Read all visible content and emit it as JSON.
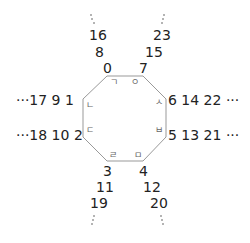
{
  "diagram": {
    "type": "octagon-cycle",
    "vertices": [
      {
        "index": "0",
        "jamo": "ㄱ"
      },
      {
        "index": "1",
        "jamo": "ㄴ"
      },
      {
        "index": "2",
        "jamo": "ㄷ"
      },
      {
        "index": "3",
        "jamo": "ㄹ"
      },
      {
        "index": "4",
        "jamo": "ㅁ"
      },
      {
        "index": "5",
        "jamo": "ㅂ"
      },
      {
        "index": "6",
        "jamo": "ㅅ"
      },
      {
        "index": "7",
        "jamo": "ㅇ"
      }
    ],
    "sequences": {
      "top_left": [
        "0",
        "8",
        "16"
      ],
      "top_right": [
        "7",
        "15",
        "23"
      ],
      "left_upper": "···17  9   1",
      "left_lower": "···18 10  2",
      "right_upper": "6  14  22 ···",
      "right_lower": "5  13  21 ···",
      "bottom_left": [
        "3",
        "11",
        "19"
      ],
      "bottom_right": [
        "4",
        "12",
        "20"
      ]
    },
    "ellipsis_vertical": "⋮",
    "line_color": "#999999"
  }
}
